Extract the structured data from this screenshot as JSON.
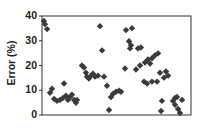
{
  "chart_data": {
    "type": "scatter",
    "title": "",
    "xlabel": "",
    "ylabel": "Error (%)",
    "ylim": [
      0,
      40
    ],
    "xlim": [
      0,
      100
    ],
    "yticks": [
      0,
      10,
      20,
      30,
      40
    ],
    "ytick_labels": [
      "0",
      "10",
      "20",
      "30",
      "40"
    ],
    "xticks": [],
    "grid": false,
    "legend": null,
    "marker": "diamond",
    "marker_color": "#3a3a3a",
    "series": [
      {
        "name": "Error",
        "points": [
          [
            1.3,
            38.0
          ],
          [
            2.0,
            36.7
          ],
          [
            3.4,
            34.7
          ],
          [
            5.4,
            9.0
          ],
          [
            6.7,
            10.6
          ],
          [
            8.1,
            6.5
          ],
          [
            10.1,
            5.7
          ],
          [
            12.1,
            6.1
          ],
          [
            14.1,
            6.9
          ],
          [
            14.8,
            12.7
          ],
          [
            16.1,
            7.8
          ],
          [
            17.4,
            6.1
          ],
          [
            18.8,
            7.3
          ],
          [
            20.1,
            8.2
          ],
          [
            21.5,
            6.1
          ],
          [
            22.8,
            4.9
          ],
          [
            23.5,
            6.1
          ],
          [
            26.8,
            20.0
          ],
          [
            28.2,
            19.2
          ],
          [
            29.5,
            17.1
          ],
          [
            30.2,
            15.5
          ],
          [
            31.5,
            14.7
          ],
          [
            32.9,
            15.9
          ],
          [
            34.2,
            16.7
          ],
          [
            35.6,
            15.5
          ],
          [
            37.6,
            15.9
          ],
          [
            38.9,
            35.9
          ],
          [
            40.3,
            26.1
          ],
          [
            41.6,
            15.5
          ],
          [
            43.6,
            11.8
          ],
          [
            45.0,
            2.0
          ],
          [
            46.3,
            7.3
          ],
          [
            47.7,
            8.6
          ],
          [
            49.7,
            9.4
          ],
          [
            51.7,
            9.8
          ],
          [
            53.0,
            9.4
          ],
          [
            55.7,
            18.8
          ],
          [
            56.4,
            34.3
          ],
          [
            60.4,
            35.1
          ],
          [
            58.4,
            29.8
          ],
          [
            59.7,
            28.2
          ],
          [
            59.1,
            26.9
          ],
          [
            64.4,
            26.9
          ],
          [
            66.4,
            27.3
          ],
          [
            63.1,
            18.4
          ],
          [
            65.8,
            20.0
          ],
          [
            69.1,
            21.2
          ],
          [
            71.1,
            22.4
          ],
          [
            73.8,
            22.9
          ],
          [
            72.5,
            20.8
          ],
          [
            75.8,
            24.1
          ],
          [
            77.9,
            24.9
          ],
          [
            68.5,
            13.5
          ],
          [
            70.5,
            12.7
          ],
          [
            73.8,
            13.5
          ],
          [
            77.2,
            13.5
          ],
          [
            79.2,
            17.1
          ],
          [
            83.2,
            17.6
          ],
          [
            84.6,
            15.9
          ],
          [
            81.9,
            15.1
          ],
          [
            80.5,
            5.7
          ],
          [
            79.9,
            1.6
          ],
          [
            87.9,
            5.7
          ],
          [
            89.3,
            6.9
          ],
          [
            90.6,
            7.3
          ],
          [
            94.0,
            6.1
          ],
          [
            89.3,
            4.1
          ],
          [
            91.3,
            2.4
          ],
          [
            92.6,
            0.8
          ]
        ]
      }
    ]
  }
}
